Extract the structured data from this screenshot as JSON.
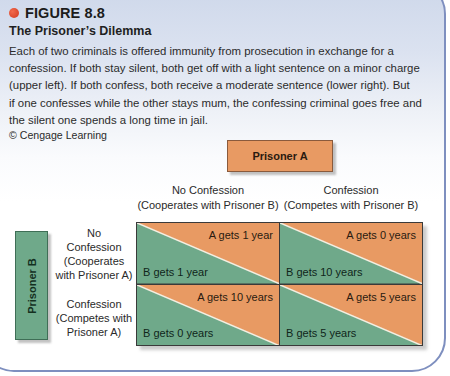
{
  "figure": {
    "number": "FIGURE 8.8",
    "title": "The Prisoner’s Dilemma",
    "caption_lines": [
      "Each of two criminals is offered immunity from prosecution in exchange for a",
      "confession. If both stay silent, both get off with a light sentence on a minor charge",
      "(upper left). If both confess, both receive a moderate sentence (lower right). But",
      "if one confesses while the other stays mum, the confessing criminal goes free and",
      "the silent one spends a long time in jail."
    ],
    "credit": "© Cengage Learning"
  },
  "colors": {
    "prisoner_a": "#e89a63",
    "prisoner_b": "#6fa98a",
    "bullet": "#e0472a",
    "card_border": "#7e8fbf"
  },
  "matrix": {
    "player_a_label": "Prisoner A",
    "player_b_label": "Prisoner B",
    "columns": [
      {
        "line1": "No Confession",
        "line2": "(Cooperates with Prisoner B)"
      },
      {
        "line1": "Confession",
        "line2": "(Competes with Prisoner B)"
      }
    ],
    "rows": [
      {
        "lines": [
          "No",
          "Confession",
          "(Cooperates",
          "with Prisoner A)"
        ]
      },
      {
        "lines": [
          "Confession",
          "(Competes with",
          "Prisoner A)"
        ]
      }
    ],
    "cells": [
      {
        "a": "A gets 1 year",
        "b": "B gets 1 year"
      },
      {
        "a": "A gets 0 years",
        "b": "B gets 10 years"
      },
      {
        "a": "A gets 10 years",
        "b": "B gets 0 years"
      },
      {
        "a": "A gets 5 years",
        "b": "B gets 5 years"
      }
    ]
  }
}
